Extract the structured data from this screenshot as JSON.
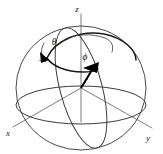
{
  "figure": {
    "background_color": "#ffffff",
    "width": 163,
    "height": 154
  },
  "axes": {
    "z": {
      "label": "z",
      "label_x": 80,
      "label_y": 11,
      "line_from_x": 81,
      "line_from_y": 88,
      "line_to_x": 81,
      "line_to_y": 14,
      "color": "#6e6e6e"
    },
    "x": {
      "label": "x",
      "label_x": 9,
      "label_y": 133,
      "line_from_x": 81,
      "line_from_y": 88,
      "line_to_x": 13,
      "line_to_y": 127,
      "color": "#6e6e6e"
    },
    "y": {
      "label": "y",
      "label_x": 148,
      "label_y": 137,
      "line_from_x": 81,
      "line_from_y": 88,
      "line_to_x": 152,
      "line_to_y": 128,
      "color": "#6e6e6e"
    }
  },
  "sphere": {
    "center_x": 81,
    "center_y": 88,
    "radius_x": 65,
    "radius_y": 62,
    "outline_color": "#4a4a4a",
    "equator_ry": 18,
    "meridian_rx": 20,
    "meridian_rotation": -14
  },
  "vector": {
    "label": "r",
    "label_x": 85,
    "label_y": 80,
    "origin_x": 81,
    "origin_y": 88,
    "tip_x": 95,
    "tip_y": 66,
    "color": "#000000"
  },
  "angles": {
    "theta": {
      "label": "θ",
      "label_x": 57,
      "label_y": 44,
      "color": "#1a1a1a",
      "arrow_tip_x": 48,
      "arrow_tip_y": 59
    },
    "phi": {
      "label": "ϕ",
      "label_x": 85,
      "label_y": 60,
      "color": "#1a1a1a"
    }
  },
  "icons": {
    "arrowhead": "arrowhead-icon",
    "sphere": "sphere-icon"
  }
}
